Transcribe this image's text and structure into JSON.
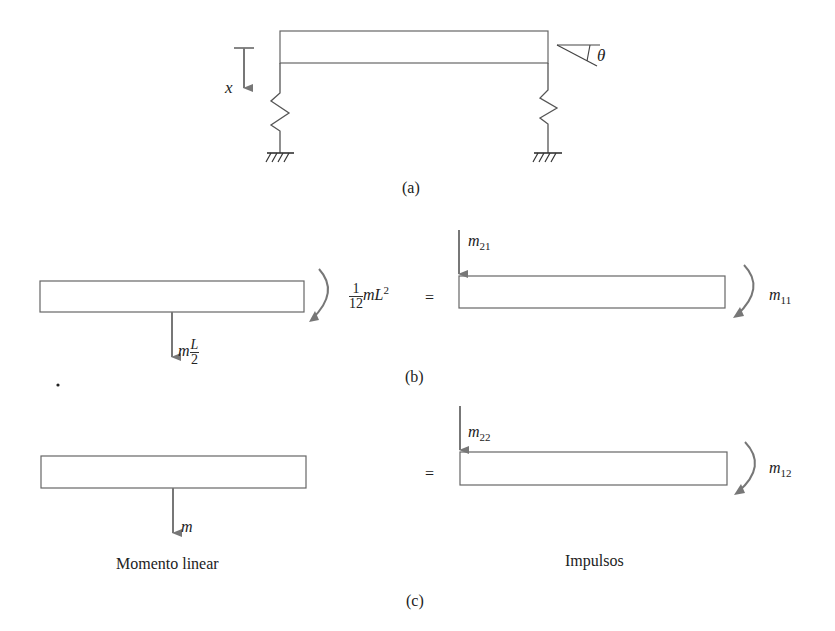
{
  "figure": {
    "panel_a": {
      "caption": "(a)",
      "labels": {
        "displacement": "x",
        "rotation": "θ"
      }
    },
    "panel_b": {
      "caption": "(b)",
      "left_force": {
        "var": "m",
        "frac_num": "L",
        "frac_den": "2"
      },
      "left_moment": {
        "frac_num": "1",
        "frac_den": "12",
        "expr": "mL",
        "power": "2"
      },
      "equals": "=",
      "right_force": {
        "var": "m",
        "sub": "21"
      },
      "right_moment": {
        "var": "m",
        "sub": "11"
      }
    },
    "panel_c": {
      "caption": "(c)",
      "left_force": {
        "var": "m"
      },
      "equals": "=",
      "right_force": {
        "var": "m",
        "sub": "22"
      },
      "right_moment": {
        "var": "m",
        "sub": "12"
      },
      "left_title": "Momento linear",
      "right_title": "Impulsos"
    }
  },
  "colors": {
    "line": "#666666",
    "arrow": "#777777",
    "text": "#222222"
  }
}
